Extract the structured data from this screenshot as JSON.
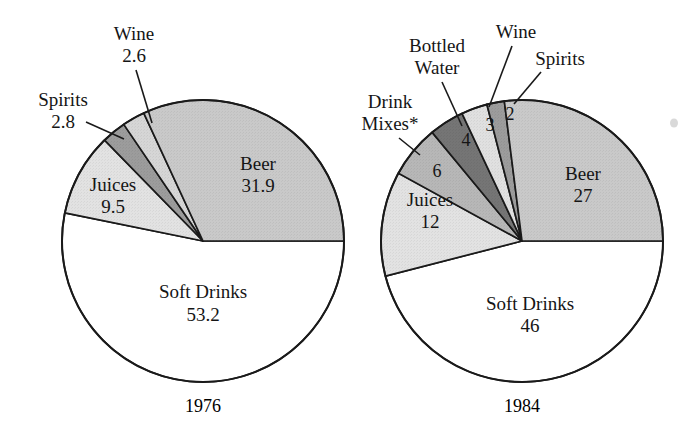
{
  "figure": {
    "title": "",
    "footnote_marker": "*"
  },
  "chart_data": {
    "type": "pie",
    "title": "",
    "xlabel": "",
    "ylabel": "",
    "legend_position": "none",
    "grid": false,
    "units": "percent share",
    "charts": [
      {
        "name": "1976",
        "year_label": "1976",
        "center": [
          203,
          241
        ],
        "radius": 141,
        "start_angle_deg": 0,
        "direction": "counterclockwise",
        "categories": [
          "Beer",
          "Wine",
          "Spirits",
          "Juices",
          "Soft Drinks"
        ],
        "values": [
          31.9,
          2.6,
          2.8,
          9.5,
          53.2
        ],
        "slices": [
          {
            "label": "Beer",
            "value": "31.9",
            "value_num": 31.9,
            "color": "#c9c9c9",
            "label_placement": "inside"
          },
          {
            "label": "Wine",
            "value": "2.6",
            "value_num": 2.6,
            "color": "#d6d6d6",
            "label_placement": "leader"
          },
          {
            "label": "Spirits",
            "value": "2.8",
            "value_num": 2.8,
            "color": "#9c9c9c",
            "label_placement": "leader"
          },
          {
            "label": "Juices",
            "value": "9.5",
            "value_num": 9.5,
            "color": "#e2e2e2",
            "label_placement": "inside"
          },
          {
            "label": "Soft Drinks",
            "value": "53.2",
            "value_num": 53.2,
            "color": "#ffffff",
            "label_placement": "inside"
          }
        ]
      },
      {
        "name": "1984",
        "year_label": "1984",
        "center": [
          522,
          241
        ],
        "radius": 141,
        "start_angle_deg": 0,
        "direction": "counterclockwise",
        "categories": [
          "Beer",
          "Spirits",
          "Wine",
          "Bottled Water",
          "Drink Mixes",
          "Juices",
          "Soft Drinks"
        ],
        "values": [
          27,
          2,
          3,
          4,
          6,
          12,
          46
        ],
        "slices": [
          {
            "label": "Beer",
            "value": "27",
            "value_num": 27,
            "color": "#c9c9c9",
            "label_placement": "inside"
          },
          {
            "label": "Spirits",
            "value": "2",
            "value_num": 2,
            "color": "#9c9c9c",
            "label_placement": "leader-number-inside"
          },
          {
            "label": "Wine",
            "value": "3",
            "value_num": 3,
            "color": "#e0e0e0",
            "label_placement": "leader-number-inside"
          },
          {
            "label": "Bottled Water",
            "value": "4",
            "value_num": 4,
            "color": "#757575",
            "label_placement": "leader-number-inside"
          },
          {
            "label": "Drink Mixes*",
            "value": "6",
            "value_num": 6,
            "color": "#b7b7b7",
            "label_placement": "leader-number-inside"
          },
          {
            "label": "Juices",
            "value": "12",
            "value_num": 12,
            "color": "#e2e2e2",
            "label_placement": "inside"
          },
          {
            "label": "Soft Drinks",
            "value": "46",
            "value_num": 46,
            "color": "#ffffff",
            "label_placement": "inside"
          }
        ]
      }
    ]
  },
  "labels": {
    "left": {
      "wine_name": "Wine",
      "wine_value": "2.6",
      "spirits_name": "Spirits",
      "spirits_value": "2.8",
      "juices_name": "Juices",
      "juices_value": "9.5",
      "beer_name": "Beer",
      "beer_value": "31.9",
      "soft_drinks_name": "Soft Drinks",
      "soft_drinks_value": "53.2",
      "year": "1976"
    },
    "right": {
      "drink_mixes_name_line1": "Drink",
      "drink_mixes_name_line2": "Mixes*",
      "drink_mixes_value": "6",
      "bottled_water_name_line1": "Bottled",
      "bottled_water_name_line2": "Water",
      "bottled_water_value": "4",
      "wine_name": "Wine",
      "wine_value": "3",
      "spirits_name": "Spirits",
      "spirits_value": "2",
      "juices_name": "Juices",
      "juices_value": "12",
      "beer_name": "Beer",
      "beer_value": "27",
      "soft_drinks_name": "Soft Drinks",
      "soft_drinks_value": "46",
      "year": "1984"
    }
  },
  "colors": {
    "outline": "#1a1a1a",
    "text": "#151515",
    "background": "#ffffff",
    "beer": "#c9c9c9",
    "juices": "#e2e2e2",
    "wine_left": "#d6d6d6",
    "wine_right": "#e0e0e0",
    "spirits": "#9c9c9c",
    "bottled_water": "#757575",
    "drink_mixes": "#b7b7b7",
    "soft_drinks": "#ffffff"
  }
}
